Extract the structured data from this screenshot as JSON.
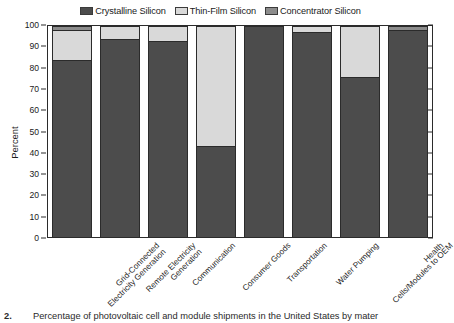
{
  "chart_data": {
    "type": "bar",
    "stacked": true,
    "title": "",
    "xlabel": "",
    "ylabel": "Percent",
    "ylim": [
      0,
      100
    ],
    "yticks": [
      0,
      10,
      20,
      30,
      40,
      50,
      60,
      70,
      80,
      90,
      100
    ],
    "grid": false,
    "legend_position": "top-center",
    "categories": [
      "Grid-Connected Electricity Generation",
      "Remote Electricity Generation",
      "Communication",
      "Consumer Goods",
      "Transportation",
      "Water Pumping",
      "Cells/Modules to OEM",
      "Health"
    ],
    "category_lines": [
      [
        "Grid-Connected",
        "Electricity Generation"
      ],
      [
        "Remote Electricity",
        "Generation"
      ],
      [
        "Communication"
      ],
      [
        "Consumer Goods"
      ],
      [
        "Transportation"
      ],
      [
        "Water Pumping"
      ],
      [
        "Cells/Modules to OEM"
      ],
      [
        "Health"
      ]
    ],
    "series": [
      {
        "name": "Crystalline Silicon",
        "color": "#4c4c4c",
        "values": [
          84,
          94,
          93,
          43,
          100,
          97,
          76,
          98
        ]
      },
      {
        "name": "Thin-Film Silicon",
        "color": "#d9d9d9",
        "values": [
          14,
          6,
          7,
          57,
          0,
          3,
          24,
          0
        ]
      },
      {
        "name": "Concentrator Silicon",
        "color": "#8c8c8c",
        "values": [
          2,
          0,
          0,
          0,
          0,
          0,
          0,
          2
        ]
      }
    ]
  },
  "legend": {
    "entries": [
      {
        "label": "Crystalline Silicon",
        "swatch": "#4c4c4c"
      },
      {
        "label": "Thin-Film Silicon",
        "swatch": "#d9d9d9"
      },
      {
        "label": "Concentrator Silicon",
        "swatch": "#8c8c8c"
      }
    ]
  },
  "axis": {
    "y_label": "Percent",
    "y_tick_labels": [
      "100",
      "90",
      "80",
      "70",
      "60",
      "50",
      "40",
      "30",
      "20",
      "10",
      "0"
    ]
  },
  "caption": {
    "number": "2.",
    "text": "Percentage of photovoltaic cell and module shipments in the United States by mater"
  },
  "colors": {
    "crystalline": "#4c4c4c",
    "thin_film": "#d9d9d9",
    "concentrator": "#8c8c8c",
    "plot_background": "#ffffff",
    "axis": "#2b2b2b"
  }
}
